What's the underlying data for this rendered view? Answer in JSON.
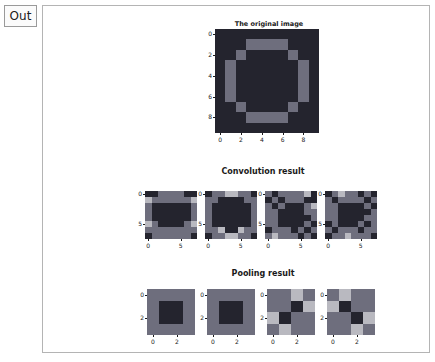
{
  "notebook": {
    "out_prompt": "Out"
  },
  "figure": {
    "titles": {
      "original": "The original image",
      "convolution": "Convolution result",
      "pooling": "Pooling result"
    }
  },
  "colors": {
    "dark": "#24242e",
    "mid": "#6e6e7d",
    "light": "#b9b9c0",
    "brightest": "#d8d8dc",
    "text": "#1a1a1a",
    "background": "#ffffff",
    "frame_border": "#b4b4b4",
    "prompt_border": "#9a9a9a"
  },
  "chart_data": [
    {
      "type": "heatmap",
      "title": "The original image",
      "xlabel": "",
      "ylabel": "",
      "xticks": [
        0,
        2,
        4,
        6,
        8
      ],
      "yticks": [
        0,
        2,
        4,
        6,
        8
      ],
      "rows": 10,
      "cols": 10,
      "colormap": [
        "#24242e",
        "#6e6e7d"
      ],
      "values": [
        [
          0,
          0,
          0,
          0,
          0,
          0,
          0,
          0,
          0,
          0
        ],
        [
          0,
          0,
          0,
          1,
          1,
          1,
          1,
          0,
          0,
          0
        ],
        [
          0,
          0,
          1,
          0,
          0,
          0,
          0,
          1,
          0,
          0
        ],
        [
          0,
          1,
          0,
          0,
          0,
          0,
          0,
          0,
          1,
          0
        ],
        [
          0,
          1,
          0,
          0,
          0,
          0,
          0,
          0,
          1,
          0
        ],
        [
          0,
          1,
          0,
          0,
          0,
          0,
          0,
          0,
          1,
          0
        ],
        [
          0,
          1,
          0,
          0,
          0,
          0,
          0,
          0,
          1,
          0
        ],
        [
          0,
          0,
          1,
          0,
          0,
          0,
          0,
          1,
          0,
          0
        ],
        [
          0,
          0,
          0,
          1,
          1,
          1,
          1,
          0,
          0,
          0
        ],
        [
          0,
          0,
          0,
          0,
          0,
          0,
          0,
          0,
          0,
          0
        ]
      ]
    },
    {
      "type": "heatmap",
      "title": "Convolution result 1",
      "xticks": [
        0,
        5
      ],
      "yticks": [
        0,
        5
      ],
      "rows": 8,
      "cols": 8,
      "colormap": [
        "#24242e",
        "#6e6e7d",
        "#b9b9c0",
        "#d8d8dc"
      ],
      "values": [
        [
          0,
          0,
          1,
          1,
          1,
          1,
          0,
          0
        ],
        [
          2,
          1,
          1,
          1,
          1,
          1,
          1,
          2
        ],
        [
          1,
          0,
          0,
          0,
          0,
          0,
          0,
          1
        ],
        [
          1,
          0,
          0,
          0,
          0,
          0,
          0,
          1
        ],
        [
          1,
          0,
          0,
          0,
          0,
          0,
          0,
          1
        ],
        [
          2,
          1,
          0,
          0,
          0,
          0,
          1,
          2
        ],
        [
          1,
          1,
          1,
          1,
          1,
          1,
          1,
          1
        ],
        [
          0,
          1,
          1,
          1,
          1,
          1,
          1,
          0
        ]
      ]
    },
    {
      "type": "heatmap",
      "title": "Convolution result 2",
      "xticks": [
        0,
        5
      ],
      "yticks": [
        0,
        5
      ],
      "rows": 8,
      "cols": 8,
      "colormap": [
        "#24242e",
        "#6e6e7d",
        "#b9b9c0",
        "#d8d8dc"
      ],
      "values": [
        [
          0,
          1,
          1,
          2,
          2,
          1,
          1,
          0
        ],
        [
          1,
          1,
          0,
          0,
          0,
          0,
          1,
          1
        ],
        [
          1,
          0,
          0,
          0,
          0,
          0,
          0,
          1
        ],
        [
          1,
          0,
          0,
          0,
          0,
          0,
          0,
          1
        ],
        [
          1,
          0,
          0,
          0,
          0,
          0,
          0,
          1
        ],
        [
          1,
          0,
          0,
          0,
          0,
          0,
          0,
          1
        ],
        [
          1,
          1,
          2,
          0,
          0,
          2,
          1,
          1
        ],
        [
          0,
          1,
          1,
          2,
          2,
          1,
          1,
          0
        ]
      ]
    },
    {
      "type": "heatmap",
      "title": "Convolution result 3",
      "xticks": [
        0,
        5
      ],
      "yticks": [
        0,
        5
      ],
      "rows": 8,
      "cols": 8,
      "colormap": [
        "#24242e",
        "#6e6e7d",
        "#b9b9c0",
        "#d8d8dc"
      ],
      "values": [
        [
          1,
          0,
          1,
          1,
          1,
          1,
          2,
          0
        ],
        [
          0,
          1,
          0,
          1,
          1,
          1,
          0,
          0
        ],
        [
          1,
          0,
          1,
          0,
          0,
          0,
          1,
          2
        ],
        [
          1,
          1,
          0,
          0,
          0,
          0,
          1,
          1
        ],
        [
          1,
          1,
          0,
          0,
          0,
          0,
          0,
          1
        ],
        [
          1,
          1,
          0,
          0,
          0,
          0,
          1,
          0
        ],
        [
          0,
          1,
          1,
          1,
          0,
          1,
          0,
          1
        ],
        [
          1,
          2,
          1,
          1,
          1,
          0,
          1,
          0
        ]
      ]
    },
    {
      "type": "heatmap",
      "title": "Convolution result 4",
      "xticks": [
        0,
        5
      ],
      "yticks": [
        0,
        5
      ],
      "rows": 8,
      "cols": 8,
      "colormap": [
        "#24242e",
        "#6e6e7d",
        "#b9b9c0",
        "#d8d8dc"
      ],
      "values": [
        [
          0,
          1,
          2,
          1,
          1,
          0,
          1,
          0
        ],
        [
          1,
          0,
          1,
          1,
          1,
          1,
          0,
          1
        ],
        [
          1,
          1,
          0,
          0,
          0,
          0,
          1,
          0
        ],
        [
          1,
          1,
          0,
          0,
          0,
          0,
          0,
          1
        ],
        [
          1,
          1,
          0,
          0,
          0,
          0,
          1,
          1
        ],
        [
          0,
          1,
          0,
          0,
          0,
          1,
          0,
          1
        ],
        [
          1,
          0,
          1,
          1,
          1,
          0,
          1,
          1
        ],
        [
          0,
          1,
          1,
          2,
          1,
          1,
          1,
          0
        ]
      ]
    },
    {
      "type": "heatmap",
      "title": "Pooling result 1",
      "xticks": [
        0,
        2
      ],
      "yticks": [
        0,
        2
      ],
      "rows": 4,
      "cols": 4,
      "colormap": [
        "#24242e",
        "#6e6e7d",
        "#b9b9c0",
        "#d8d8dc"
      ],
      "values": [
        [
          1,
          1,
          1,
          1
        ],
        [
          1,
          0,
          0,
          1
        ],
        [
          1,
          0,
          0,
          1
        ],
        [
          1,
          1,
          1,
          1
        ]
      ]
    },
    {
      "type": "heatmap",
      "title": "Pooling result 2",
      "xticks": [
        0,
        2
      ],
      "yticks": [
        0,
        2
      ],
      "rows": 4,
      "cols": 4,
      "colormap": [
        "#24242e",
        "#6e6e7d",
        "#b9b9c0",
        "#d8d8dc"
      ],
      "values": [
        [
          1,
          1,
          1,
          1
        ],
        [
          1,
          0,
          0,
          1
        ],
        [
          1,
          0,
          0,
          1
        ],
        [
          1,
          1,
          1,
          1
        ]
      ]
    },
    {
      "type": "heatmap",
      "title": "Pooling result 3",
      "xticks": [
        0,
        2
      ],
      "yticks": [
        0,
        2
      ],
      "rows": 4,
      "cols": 4,
      "colormap": [
        "#24242e",
        "#6e6e7d",
        "#b9b9c0",
        "#d8d8dc"
      ],
      "values": [
        [
          1,
          1,
          2,
          1
        ],
        [
          1,
          1,
          0,
          2
        ],
        [
          2,
          0,
          1,
          1
        ],
        [
          1,
          2,
          1,
          1
        ]
      ]
    },
    {
      "type": "heatmap",
      "title": "Pooling result 4",
      "xticks": [
        0,
        2
      ],
      "yticks": [
        0,
        2
      ],
      "rows": 4,
      "cols": 4,
      "colormap": [
        "#24242e",
        "#6e6e7d",
        "#b9b9c0",
        "#d8d8dc"
      ],
      "values": [
        [
          1,
          2,
          1,
          1
        ],
        [
          2,
          0,
          1,
          1
        ],
        [
          1,
          1,
          0,
          2
        ],
        [
          1,
          1,
          2,
          1
        ]
      ]
    }
  ],
  "layout": {
    "original": {
      "left": 172,
      "top": 23,
      "width": 104,
      "height": 104
    },
    "conv_row": {
      "top": 185,
      "width": 52,
      "height": 48,
      "lefts": [
        102,
        162,
        222,
        282
      ]
    },
    "pool_row": {
      "top": 283,
      "width": 48,
      "height": 46,
      "lefts": [
        104,
        164,
        224,
        284
      ]
    },
    "titles": {
      "original": {
        "left": 174,
        "top": 14
      },
      "convolution": {
        "left": 160,
        "top": 161
      },
      "pooling": {
        "left": 166,
        "top": 263
      }
    }
  }
}
